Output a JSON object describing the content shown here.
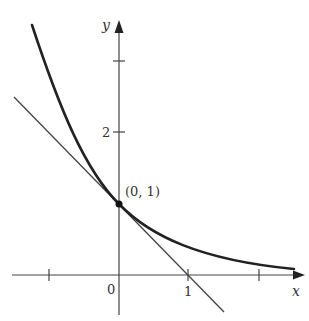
{
  "diagram": {
    "curve": {
      "function": "y = e^(-x)",
      "color": "#222222"
    },
    "tangent_line": {
      "function": "y = 1 - x",
      "color": "#444444"
    },
    "point": {
      "label": "(0, 1)",
      "x": 0,
      "y": 1
    },
    "axes": {
      "x_label": "x",
      "y_label": "y",
      "x_ticks": [
        -1,
        0,
        1,
        2
      ],
      "x_tick_labels": {
        "origin": "0",
        "one": "1"
      },
      "y_ticks": [
        1,
        2,
        3
      ],
      "y_tick_labels": {
        "two": "2"
      }
    }
  }
}
